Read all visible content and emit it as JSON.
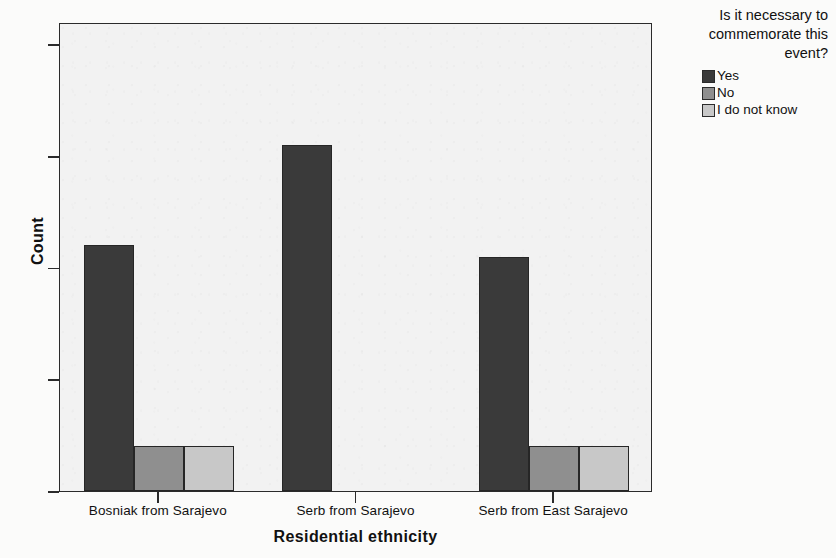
{
  "chart_data": {
    "type": "bar",
    "title": "",
    "xlabel": "Residential ethnicity",
    "ylabel": "Count",
    "categories": [
      "Bosniak from Sarajevo",
      "Serb from Sarajevo",
      "Serb from East Sarajevo"
    ],
    "series": [
      {
        "name": "Yes",
        "color": "#3a3a3a",
        "values": [
          22,
          31,
          21
        ]
      },
      {
        "name": "No",
        "color": "#8f8f8f",
        "values": [
          4,
          0,
          4
        ]
      },
      {
        "name": "I do not know",
        "color": "#c8c8c8",
        "values": [
          4,
          0,
          4
        ]
      }
    ],
    "ylim": [
      0,
      42
    ],
    "yticks": [
      0,
      10,
      20,
      30,
      40
    ],
    "ytick_labels": [
      "0",
      "10",
      "20",
      "30",
      "40"
    ],
    "grid": false,
    "legend_position": "top-right",
    "legend_title": "Is it necessary to commemorate this event?"
  },
  "axes": {
    "y_title": "Count",
    "x_title": "Residential ethnicity"
  },
  "legend": {
    "title_lines": [
      "Is it necessary to",
      "commemorate this",
      "event?"
    ],
    "items": [
      {
        "label": "Yes",
        "color": "#3a3a3a"
      },
      {
        "label": "No",
        "color": "#8f8f8f"
      },
      {
        "label": "I do not know",
        "color": "#c8c8c8"
      }
    ]
  },
  "plot": {
    "background_color": "#f2f2f2",
    "frame_color": "#2b2b2b"
  }
}
